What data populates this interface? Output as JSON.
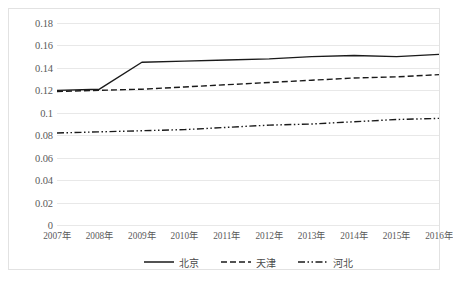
{
  "chart_data": {
    "type": "line",
    "title": "",
    "xlabel": "",
    "ylabel": "",
    "categories": [
      "2007年",
      "2008年",
      "2009年",
      "2010年",
      "2011年",
      "2012年",
      "2013年",
      "2014年",
      "2015年",
      "2016年"
    ],
    "ylim": [
      0,
      0.18
    ],
    "ytick_labels": [
      "0",
      "0.02",
      "0.04",
      "0.06",
      "0.08",
      "0.1",
      "0.12",
      "0.14",
      "0.16",
      "0.18"
    ],
    "ytick_values": [
      0,
      0.02,
      0.04,
      0.06,
      0.08,
      0.1,
      0.12,
      0.14,
      0.16,
      0.18
    ],
    "grid": true,
    "legend_position": "bottom",
    "series": [
      {
        "name": "北京",
        "style": "solid",
        "color": "#1a1a1a",
        "values": [
          0.12,
          0.121,
          0.145,
          0.146,
          0.147,
          0.148,
          0.15,
          0.151,
          0.15,
          0.152
        ]
      },
      {
        "name": "天津",
        "style": "dashed",
        "color": "#1a1a1a",
        "values": [
          0.119,
          0.12,
          0.121,
          0.123,
          0.125,
          0.127,
          0.129,
          0.131,
          0.132,
          0.134
        ]
      },
      {
        "name": "河北",
        "style": "dash-dot",
        "color": "#1a1a1a",
        "values": [
          0.082,
          0.083,
          0.084,
          0.085,
          0.087,
          0.089,
          0.09,
          0.092,
          0.094,
          0.095
        ]
      }
    ]
  }
}
